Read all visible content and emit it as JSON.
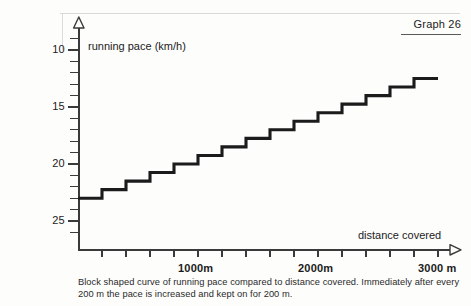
{
  "graph_tag": "Graph 26",
  "caption": "Block shaped curve of running pace compared to distance covered. Immediately after every 200 m the pace is increased and kept on for 200 m.",
  "axes": {
    "y_title": "running pace (km/h)",
    "x_title": "distance covered",
    "y_major_labels": [
      "25",
      "20",
      "15",
      "10"
    ],
    "x_labels": [
      "1000m",
      "2000m",
      "3000 m"
    ]
  },
  "colors": {
    "curve": "#1b1b1b",
    "axis": "#3a3a3a",
    "background": "#fdfdfc",
    "text": "#1b1b1b"
  },
  "chart_data": {
    "type": "line",
    "title": "Graph 26",
    "subtitle": "Block shaped curve of running pace compared to distance covered. Immediately after every 200 m the pace is increased and kept on for 200 m.",
    "xlabel": "distance covered",
    "ylabel": "running pace (km/h)",
    "xlim": [
      0,
      3200
    ],
    "ylim": [
      8,
      26
    ],
    "x_unit": "m",
    "y_unit": "km/h",
    "xticks": [
      200,
      400,
      600,
      800,
      1000,
      1200,
      1400,
      1600,
      1800,
      2000,
      2200,
      2400,
      2600,
      2800,
      3000
    ],
    "xtick_labels": [
      "",
      "",
      "",
      "",
      "1000m",
      "",
      "",
      "",
      "",
      "2000m",
      "",
      "",
      "",
      "",
      "3000 m"
    ],
    "yticks_major": [
      10,
      15,
      20,
      25
    ],
    "yticks_minor": [
      11,
      12,
      13,
      14,
      16,
      17,
      18,
      19,
      21,
      22,
      23,
      24
    ],
    "grid": false,
    "legend": null,
    "step_width_m": 200,
    "step_increment_kmh": 0.75,
    "x": [
      0,
      200,
      400,
      600,
      800,
      1000,
      1200,
      1400,
      1600,
      1800,
      2000,
      2200,
      2400,
      2600,
      2800
    ],
    "values": [
      12.0,
      12.75,
      13.5,
      14.25,
      15.0,
      15.75,
      16.5,
      17.25,
      18.0,
      18.75,
      19.5,
      20.25,
      21.0,
      21.75,
      22.5
    ],
    "series": [
      {
        "name": "running pace",
        "shape": "step-post",
        "values": [
          12.0,
          12.75,
          13.5,
          14.25,
          15.0,
          15.75,
          16.5,
          17.25,
          18.0,
          18.75,
          19.5,
          20.25,
          21.0,
          21.75,
          22.5
        ]
      }
    ]
  }
}
